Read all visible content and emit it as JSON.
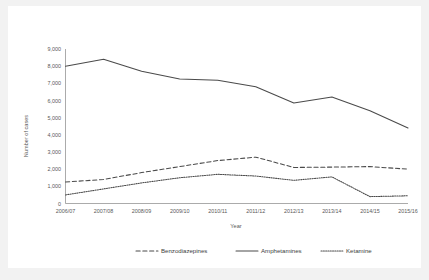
{
  "chart_data": {
    "type": "line",
    "title": "",
    "xlabel": "Year",
    "ylabel": "Number of cases",
    "categories": [
      "2006/07",
      "2007/08",
      "2008/09",
      "2009/10",
      "2010/11",
      "2011/12",
      "2012/13",
      "2013/14",
      "2014/15",
      "2015/16"
    ],
    "ylim": [
      0,
      9000
    ],
    "ytick_labels": [
      "0",
      "1,000",
      "2,000",
      "3,000",
      "4,000",
      "5,000",
      "6,000",
      "7,000",
      "8,000",
      "9,000"
    ],
    "ytick_values": [
      0,
      1000,
      2000,
      3000,
      4000,
      5000,
      6000,
      7000,
      8000,
      9000
    ],
    "grid": false,
    "legend_position": "bottom",
    "series": [
      {
        "name": "Benzodiazepines",
        "style": "dashed",
        "values": [
          1250,
          1400,
          1800,
          2150,
          2500,
          2700,
          2100,
          2120,
          2150,
          2000
        ]
      },
      {
        "name": "Amphetamines",
        "style": "solid",
        "values": [
          8000,
          8400,
          7700,
          7250,
          7180,
          6800,
          5850,
          6200,
          5400,
          4400
        ]
      },
      {
        "name": "Ketamine",
        "style": "dotted",
        "values": [
          500,
          850,
          1200,
          1500,
          1700,
          1600,
          1350,
          1550,
          400,
          450
        ]
      }
    ]
  },
  "legend": {
    "items": [
      {
        "label": "Benzodiazepines",
        "style": "dashed"
      },
      {
        "label": "Amphetamines",
        "style": "solid"
      },
      {
        "label": "Ketamine",
        "style": "dotted"
      }
    ]
  }
}
